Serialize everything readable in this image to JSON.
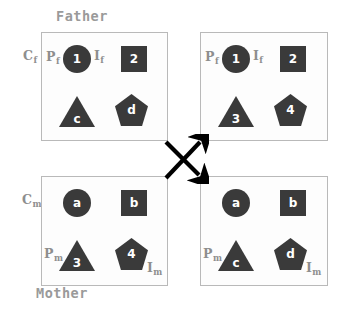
{
  "figure": {
    "title_father": "Father",
    "title_mother": "Mother",
    "shape_colors": {
      "allele_fill": "#3a3a3a",
      "allele_text": "#ffffff",
      "box_border": "#b9b9b9",
      "box_fill": "#fdfdfd",
      "label_gray": "#9a9a9a",
      "annotation_gray": "#8e8e8e",
      "arrow_black": "#000000"
    },
    "chromosome_labels": {
      "father": "C",
      "father_sub": "f",
      "mother": "C",
      "mother_sub": "m"
    },
    "locus_labels": {
      "p_father": "P",
      "p_father_sub": "f",
      "i_father": "I",
      "i_father_sub": "f",
      "p_mother": "P",
      "p_mother_sub": "m",
      "i_mother": "I",
      "i_mother_sub": "m"
    },
    "crossover_symbol": "crossing-arrows"
  },
  "boxes": {
    "father_left": {
      "name": "Father parent chromosome",
      "alleles": {
        "circle": "1",
        "square": "2",
        "triangle": "c",
        "pentagon": "d"
      }
    },
    "father_right": {
      "name": "Father offspring chromosome",
      "alleles": {
        "circle": "1",
        "square": "2",
        "triangle": "3",
        "pentagon": "4"
      }
    },
    "mother_left": {
      "name": "Mother parent chromosome",
      "alleles": {
        "circle": "a",
        "square": "b",
        "triangle": "3",
        "pentagon": "4"
      }
    },
    "mother_right": {
      "name": "Mother offspring chromosome",
      "alleles": {
        "circle": "a",
        "square": "b",
        "triangle": "c",
        "pentagon": "d"
      }
    }
  }
}
